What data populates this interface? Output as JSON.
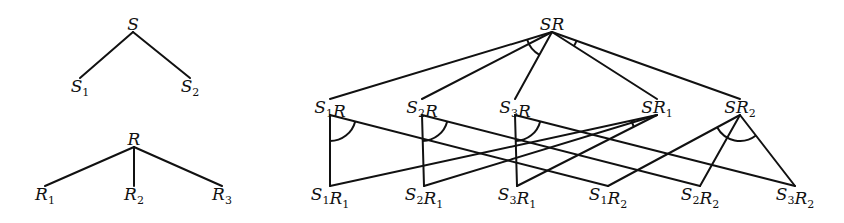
{
  "diagram": {
    "stroke_color": "#111111",
    "background": "#ffffff",
    "trees": [
      {
        "id": "S-tree",
        "root": {
          "id": "S",
          "base": "S",
          "sub": "",
          "x": 133,
          "y": 30
        },
        "children": [
          {
            "id": "S1",
            "base": "S",
            "sub": "1",
            "x": 80,
            "y": 92
          },
          {
            "id": "S2",
            "base": "S",
            "sub": "2",
            "x": 190,
            "y": 92
          }
        ],
        "edges": [
          [
            "S",
            "S1"
          ],
          [
            "S",
            "S2"
          ]
        ],
        "and_arcs": []
      },
      {
        "id": "R-tree",
        "root": {
          "id": "R",
          "base": "R",
          "sub": "",
          "x": 134,
          "y": 145
        },
        "children": [
          {
            "id": "R1",
            "base": "R",
            "sub": "1",
            "x": 45,
            "y": 200
          },
          {
            "id": "R2",
            "base": "R",
            "sub": "2",
            "x": 134,
            "y": 200
          },
          {
            "id": "R3",
            "base": "R",
            "sub": "3",
            "x": 222,
            "y": 200
          }
        ],
        "edges": [
          [
            "R",
            "R1"
          ],
          [
            "R",
            "R2"
          ],
          [
            "R",
            "R3"
          ]
        ],
        "and_arcs": []
      },
      {
        "id": "SR-tree",
        "nodes": [
          {
            "id": "SR",
            "base": "SR",
            "sub": "",
            "x": 552,
            "y": 30
          },
          {
            "id": "S1R",
            "base": "S",
            "sub": "1",
            "tail": "R",
            "x": 330,
            "y": 113
          },
          {
            "id": "S2R",
            "base": "S",
            "sub": "2",
            "tail": "R",
            "x": 422,
            "y": 113
          },
          {
            "id": "S3R",
            "base": "S",
            "sub": "3",
            "tail": "R",
            "x": 515,
            "y": 113
          },
          {
            "id": "SR1",
            "base": "SR",
            "sub": "1",
            "x": 657,
            "y": 113
          },
          {
            "id": "SR2",
            "base": "SR",
            "sub": "2",
            "x": 740,
            "y": 113
          },
          {
            "id": "S1R1",
            "base": "S",
            "sub": "1",
            "tail": "R",
            "tailsub": "1",
            "x": 330,
            "y": 200
          },
          {
            "id": "S2R1",
            "base": "S",
            "sub": "2",
            "tail": "R",
            "tailsub": "1",
            "x": 424,
            "y": 200
          },
          {
            "id": "S3R1",
            "base": "S",
            "sub": "3",
            "tail": "R",
            "tailsub": "1",
            "x": 517,
            "y": 200
          },
          {
            "id": "S1R2",
            "base": "S",
            "sub": "1",
            "tail": "R",
            "tailsub": "2",
            "x": 608,
            "y": 200
          },
          {
            "id": "S2R2",
            "base": "S",
            "sub": "2",
            "tail": "R",
            "tailsub": "2",
            "x": 700,
            "y": 200
          },
          {
            "id": "S3R2",
            "base": "S",
            "sub": "3",
            "tail": "R",
            "tailsub": "2",
            "x": 795,
            "y": 200
          }
        ],
        "edges": [
          [
            "SR",
            "S1R"
          ],
          [
            "SR",
            "S2R"
          ],
          [
            "SR",
            "S3R"
          ],
          [
            "SR",
            "SR1"
          ],
          [
            "SR",
            "SR2"
          ],
          [
            "S1R",
            "S1R1"
          ],
          [
            "S1R",
            "S1R2"
          ],
          [
            "S2R",
            "S2R1"
          ],
          [
            "S2R",
            "S2R2"
          ],
          [
            "S3R",
            "S3R1"
          ],
          [
            "S3R",
            "S3R2"
          ],
          [
            "SR1",
            "S1R1"
          ],
          [
            "SR1",
            "S2R1"
          ],
          [
            "SR1",
            "S3R1"
          ],
          [
            "SR2",
            "S1R2"
          ],
          [
            "SR2",
            "S2R2"
          ],
          [
            "SR2",
            "S3R2"
          ]
        ],
        "and_arcs": [
          {
            "at": "SR",
            "over": [
              "S1R",
              "S3R"
            ]
          },
          {
            "at": "SR",
            "over": [
              "SR1",
              "SR2"
            ]
          },
          {
            "at": "S1R",
            "over": [
              "S1R1",
              "S1R2"
            ]
          },
          {
            "at": "S2R",
            "over": [
              "S2R1",
              "S2R2"
            ]
          },
          {
            "at": "S3R",
            "over": [
              "S3R1",
              "S3R2"
            ]
          },
          {
            "at": "SR1",
            "over": [
              "S1R1",
              "S3R1"
            ]
          },
          {
            "at": "SR2",
            "over": [
              "S1R2",
              "S3R2"
            ]
          }
        ]
      }
    ],
    "labels": {
      "S": "S",
      "S1": "S1",
      "S2": "S2",
      "R": "R",
      "R1": "R1",
      "R2": "R2",
      "R3": "R3",
      "SR": "SR",
      "S1R": "S1R",
      "S2R": "S2R",
      "S3R": "S3R",
      "SR1": "SR1",
      "SR2": "SR2",
      "S1R1": "S1R1",
      "S2R1": "S2R1",
      "S3R1": "S3R1",
      "S1R2": "S1R2",
      "S2R2": "S2R2",
      "S3R2": "S3R2"
    }
  }
}
